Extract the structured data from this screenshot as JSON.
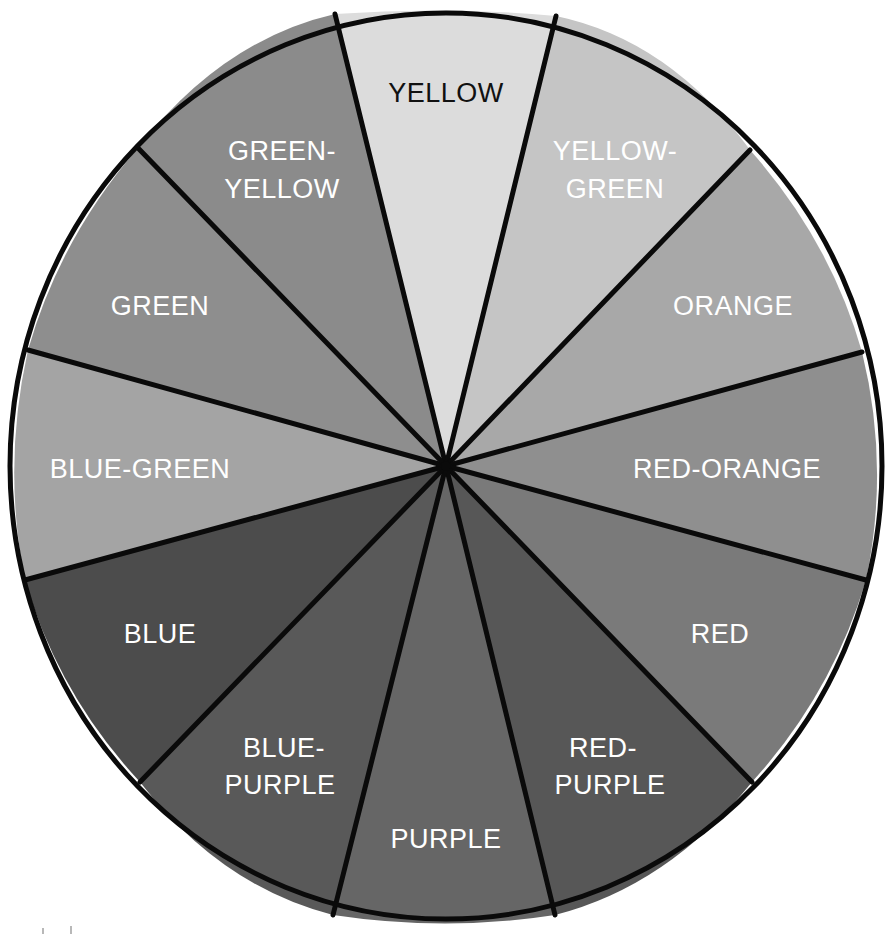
{
  "diagram": {
    "type": "color-wheel",
    "center": {
      "x": 446,
      "y": 466
    },
    "radius_x": 436,
    "radius_y": 453,
    "outline_color": "#0a0a0a",
    "background": "#ffffff",
    "wedges": [
      {
        "name": "yellow",
        "lines": [
          "YELLOW"
        ],
        "fill": "#dcdcdc",
        "text_color": "#111111",
        "p1": [
          335,
          14
        ],
        "p2": [
          556,
          16
        ],
        "label_pos": [
          446,
          92
        ],
        "mid_cp": [
          446,
          12
        ]
      },
      {
        "name": "yellow-green",
        "lines": [
          "YELLOW-",
          "GREEN"
        ],
        "fill": "#c5c5c5",
        "text_color": "#ffffff",
        "p1": [
          556,
          16
        ],
        "p2": [
          750,
          150
        ],
        "label_pos": [
          615,
          160
        ],
        "mid_cp": [
          664,
          52
        ]
      },
      {
        "name": "orange",
        "lines": [
          "ORANGE"
        ],
        "fill": "#a8a8a8",
        "text_color": "#ffffff",
        "p1": [
          750,
          150
        ],
        "p2": [
          862,
          352
        ],
        "label_pos": [
          733,
          305
        ],
        "mid_cp": [
          828,
          238
        ]
      },
      {
        "name": "red-orange",
        "lines": [
          "RED-ORANGE"
        ],
        "fill": "#8f8f8f",
        "text_color": "#ffffff",
        "p1": [
          862,
          352
        ],
        "p2": [
          866,
          580
        ],
        "label_pos": [
          727,
          468
        ],
        "mid_cp": [
          884,
          466
        ]
      },
      {
        "name": "red",
        "lines": [
          "RED"
        ],
        "fill": "#7a7a7a",
        "text_color": "#ffffff",
        "p1": [
          866,
          580
        ],
        "p2": [
          752,
          782
        ],
        "label_pos": [
          720,
          633
        ],
        "mid_cp": [
          830,
          696
        ]
      },
      {
        "name": "red-purple",
        "lines": [
          "RED-",
          "PURPLE"
        ],
        "fill": "#575757",
        "text_color": "#ffffff",
        "p1": [
          752,
          782
        ],
        "p2": [
          555,
          915
        ],
        "label_pos": [
          610,
          756
        ],
        "mid_cp": [
          668,
          880
        ]
      },
      {
        "name": "purple",
        "lines": [
          "PURPLE"
        ],
        "fill": "#666666",
        "text_color": "#ffffff",
        "p1": [
          555,
          915
        ],
        "p2": [
          333,
          915
        ],
        "label_pos": [
          446,
          838
        ],
        "mid_cp": [
          446,
          922
        ]
      },
      {
        "name": "blue-purple",
        "lines": [
          "BLUE-",
          "PURPLE"
        ],
        "fill": "#595959",
        "text_color": "#ffffff",
        "p1": [
          333,
          915
        ],
        "p2": [
          140,
          782
        ],
        "label_pos": [
          282,
          756
        ],
        "mid_cp": [
          224,
          880
        ]
      },
      {
        "name": "blue",
        "lines": [
          "BLUE"
        ],
        "fill": "#4c4c4c",
        "text_color": "#ffffff",
        "p1": [
          140,
          782
        ],
        "p2": [
          25,
          580
        ],
        "label_pos": [
          160,
          633
        ],
        "mid_cp": [
          62,
          696
        ]
      },
      {
        "name": "blue-green",
        "lines": [
          "BLUE-GREEN"
        ],
        "fill": "#a4a4a4",
        "text_color": "#ffffff",
        "p1": [
          25,
          580
        ],
        "p2": [
          28,
          350
        ],
        "label_pos": [
          140,
          468
        ],
        "mid_cp": [
          8,
          466
        ]
      },
      {
        "name": "green",
        "lines": [
          "GREEN"
        ],
        "fill": "#8e8e8e",
        "text_color": "#ffffff",
        "p1": [
          28,
          350
        ],
        "p2": [
          138,
          148
        ],
        "label_pos": [
          160,
          305
        ],
        "mid_cp": [
          62,
          238
        ]
      },
      {
        "name": "green-yellow",
        "lines": [
          "GREEN-",
          "YELLOW"
        ],
        "fill": "#8b8b8b",
        "text_color": "#ffffff",
        "p1": [
          138,
          148
        ],
        "p2": [
          335,
          14
        ],
        "label_pos": [
          282,
          160
        ],
        "mid_cp": [
          226,
          52
        ]
      }
    ]
  },
  "labels": {
    "yellow": "YELLOW",
    "yellow_green_1": "YELLOW-",
    "yellow_green_2": "GREEN",
    "orange": "ORANGE",
    "red_orange": "RED-ORANGE",
    "red": "RED",
    "red_purple_1": "RED-",
    "red_purple_2": "PURPLE",
    "purple": "PURPLE",
    "blue_purple_1": "BLUE-",
    "blue_purple_2": "PURPLE",
    "blue": "BLUE",
    "blue_green": "BLUE-GREEN",
    "green": "GREEN",
    "green_yellow_1": "GREEN-",
    "green_yellow_2": "YELLOW"
  }
}
